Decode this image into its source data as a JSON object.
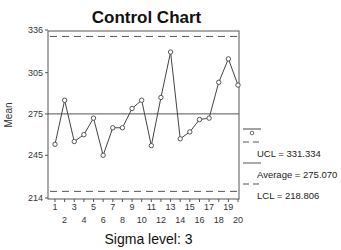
{
  "chart_data": {
    "type": "line",
    "title": "Control Chart",
    "xlabel": "",
    "ylabel": "Mean",
    "footer": "Sigma level: 3",
    "x": [
      1,
      2,
      3,
      4,
      5,
      6,
      7,
      8,
      9,
      10,
      11,
      12,
      13,
      14,
      15,
      16,
      17,
      18,
      19,
      20
    ],
    "series": [
      {
        "name": "Mean",
        "values": [
          253,
          285,
          255,
          260,
          272,
          245,
          265,
          265,
          279,
          285,
          252,
          287,
          320,
          257,
          262,
          271,
          272,
          298,
          315,
          296
        ]
      }
    ],
    "reference_lines": {
      "UCL": 331.334,
      "Average": 275.07,
      "LCL": 218.806
    },
    "ylim": [
      214,
      336
    ],
    "yticks": [
      214,
      245,
      275,
      305,
      336
    ],
    "xticks_odd": [
      1,
      3,
      5,
      7,
      9,
      11,
      13,
      15,
      17,
      19
    ],
    "xticks_even": [
      2,
      4,
      6,
      8,
      10,
      12,
      14,
      16,
      18,
      20
    ],
    "xlim": [
      1,
      20
    ],
    "grid": false,
    "legend": {
      "position": "right",
      "entries": [
        {
          "symbol": "line-with-circle",
          "label": ""
        },
        {
          "symbol": "dashed",
          "label": "UCL = 331.334"
        },
        {
          "symbol": "solid",
          "label": "Average = 275.070"
        },
        {
          "symbol": "dashed",
          "label": "LCL = 218.806"
        }
      ]
    }
  },
  "labels": {
    "title": "Control Chart",
    "ylabel": "Mean",
    "sigma": "Sigma level: 3",
    "ucl": "UCL = 331.334",
    "avg": "Average = 275.070",
    "lcl": "LCL = 218.806"
  },
  "colors": {
    "line": "#444444",
    "axis": "#555555",
    "reference": "#555555"
  }
}
